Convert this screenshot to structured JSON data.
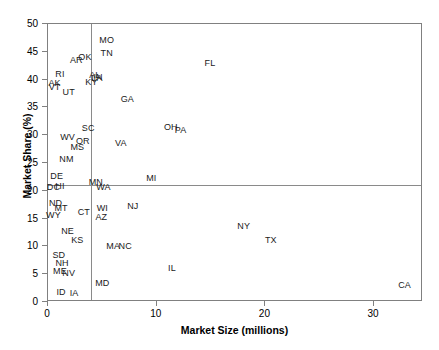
{
  "chart_data": {
    "type": "scatter",
    "title": "",
    "xlabel": "Market Size (millions)",
    "ylabel": "Market Share (%)",
    "xlim": [
      0,
      34.5
    ],
    "ylim": [
      0,
      50
    ],
    "xticks": [
      0,
      10,
      20,
      30
    ],
    "yticks": [
      0,
      5,
      10,
      15,
      20,
      25,
      30,
      35,
      40,
      45,
      50
    ],
    "xtick_labels": [
      "0",
      "10",
      "20",
      "30"
    ],
    "ytick_labels": [
      "0",
      "5",
      "10",
      "15",
      "20",
      "25",
      "30",
      "35",
      "40",
      "45",
      "50"
    ],
    "grid": false,
    "legend": "none",
    "point_style": "text-label-only",
    "reference_lines": [
      {
        "orientation": "vertical",
        "value": 4.0,
        "axis": "x"
      },
      {
        "orientation": "horizontal",
        "value": 21.0,
        "axis": "y"
      }
    ],
    "labels": [
      "MO",
      "TN",
      "AR",
      "OK",
      "RI",
      "AK",
      "VT",
      "UT",
      "MD_cluster",
      "GA",
      "SC",
      "WV",
      "OR",
      "MS",
      "NM",
      "DE",
      "DC",
      "HI",
      "MN",
      "WA",
      "MI",
      "ND",
      "MT",
      "WY",
      "CT",
      "WI",
      "AZ",
      "NJ",
      "NE",
      "KS",
      "MA",
      "NC",
      "SD",
      "NH",
      "ME",
      "NV",
      "ID",
      "IA",
      "MD",
      "IL",
      "NY",
      "TX",
      "CA",
      "FL",
      "OH",
      "PA",
      "VA",
      "KY",
      "AL",
      "IN",
      "LA",
      "NY2"
    ],
    "points": [
      {
        "label": "MO",
        "x": 5.4,
        "y": 47.2
      },
      {
        "label": "TN",
        "x": 5.4,
        "y": 44.8
      },
      {
        "label": "AR",
        "x": 2.6,
        "y": 43.5
      },
      {
        "label": "OK",
        "x": 3.4,
        "y": 44.0
      },
      {
        "label": "FL",
        "x": 14.9,
        "y": 43.0
      },
      {
        "label": "RI",
        "x": 1.1,
        "y": 41.0
      },
      {
        "label": "AL",
        "x": 4.3,
        "y": 40.8
      },
      {
        "label": "IN",
        "x": 4.6,
        "y": 40.5
      },
      {
        "label": "LA",
        "x": 4.5,
        "y": 40.2
      },
      {
        "label": "KY",
        "x": 4.0,
        "y": 39.6
      },
      {
        "label": "AK",
        "x": 0.6,
        "y": 39.3
      },
      {
        "label": "VT",
        "x": 0.6,
        "y": 38.6
      },
      {
        "label": "UT",
        "x": 1.9,
        "y": 37.8
      },
      {
        "label": "GA",
        "x": 7.3,
        "y": 36.6
      },
      {
        "label": "OH",
        "x": 11.3,
        "y": 31.5
      },
      {
        "label": "PA",
        "x": 12.2,
        "y": 31.0
      },
      {
        "label": "SC",
        "x": 3.7,
        "y": 31.3
      },
      {
        "label": "WV",
        "x": 1.8,
        "y": 29.6
      },
      {
        "label": "OR",
        "x": 3.2,
        "y": 29.0
      },
      {
        "label": "VA",
        "x": 6.7,
        "y": 28.6
      },
      {
        "label": "MS",
        "x": 2.7,
        "y": 27.8
      },
      {
        "label": "NM",
        "x": 1.7,
        "y": 25.7
      },
      {
        "label": "DE",
        "x": 0.8,
        "y": 22.6
      },
      {
        "label": "MI",
        "x": 9.5,
        "y": 22.3
      },
      {
        "label": "MN",
        "x": 4.4,
        "y": 21.6
      },
      {
        "label": "WA",
        "x": 5.1,
        "y": 20.6
      },
      {
        "label": "DC",
        "x": 0.5,
        "y": 20.7
      },
      {
        "label": "HI",
        "x": 1.1,
        "y": 20.8
      },
      {
        "label": "ND",
        "x": 0.7,
        "y": 17.8
      },
      {
        "label": "MT",
        "x": 1.2,
        "y": 16.9
      },
      {
        "label": "WI",
        "x": 5.0,
        "y": 16.9
      },
      {
        "label": "NJ",
        "x": 7.8,
        "y": 17.2
      },
      {
        "label": "CT",
        "x": 3.3,
        "y": 16.2
      },
      {
        "label": "WY",
        "x": 0.5,
        "y": 15.6
      },
      {
        "label": "AZ",
        "x": 4.9,
        "y": 15.2
      },
      {
        "label": "NE",
        "x": 1.8,
        "y": 12.8
      },
      {
        "label": "NY",
        "x": 18.0,
        "y": 13.6
      },
      {
        "label": "TX",
        "x": 20.5,
        "y": 11.2
      },
      {
        "label": "KS",
        "x": 2.7,
        "y": 11.2
      },
      {
        "label": "MA",
        "x": 6.0,
        "y": 10.0
      },
      {
        "label": "NC",
        "x": 7.1,
        "y": 10.0
      },
      {
        "label": "SD",
        "x": 1.0,
        "y": 8.5
      },
      {
        "label": "NH",
        "x": 1.3,
        "y": 7.1
      },
      {
        "label": "IL",
        "x": 11.4,
        "y": 6.1
      },
      {
        "label": "ME",
        "x": 1.1,
        "y": 5.5
      },
      {
        "label": "NV",
        "x": 1.9,
        "y": 5.2
      },
      {
        "label": "MD",
        "x": 5.0,
        "y": 3.4
      },
      {
        "label": "CA",
        "x": 32.8,
        "y": 3.1
      },
      {
        "label": "ID",
        "x": 1.2,
        "y": 1.8
      },
      {
        "label": "IA",
        "x": 2.4,
        "y": 1.7
      }
    ]
  },
  "axes": {
    "x_title": "Market Size (millions)",
    "y_title": "Market Share (%)"
  }
}
